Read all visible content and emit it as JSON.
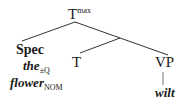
{
  "tree": {
    "root": {
      "label": "T",
      "superscript": "max"
    },
    "spec": {
      "label": "Spec",
      "word1": "the",
      "word1_sub": "±Q",
      "word2": "flower",
      "word2_sub": "NOM"
    },
    "head": {
      "label": "T"
    },
    "complement": {
      "label": "VP",
      "child": "wilt"
    }
  }
}
